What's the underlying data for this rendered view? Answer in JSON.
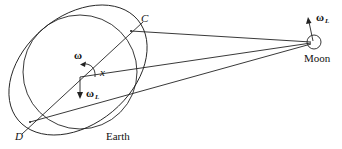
{
  "diagram": {
    "labels": {
      "point_c": "C",
      "point_d": "D",
      "axis_x": "x",
      "earth": "Earth",
      "moon": "Moon",
      "omega": "ω",
      "omega_l_earth": "ω",
      "omega_l_earth_sub": "L",
      "omega_l_moon": "ω",
      "omega_l_moon_sub": "L"
    },
    "colors": {
      "stroke": "#222222",
      "background": "#ffffff"
    },
    "shapes": {
      "earth_circle": {
        "cx": 80,
        "cy": 71,
        "r": 57
      },
      "bulge_ellipse": {
        "cx": 77,
        "cy": 71,
        "rx": 77,
        "ry": 55,
        "rotate": -38
      },
      "moon_circle": {
        "cx": 314,
        "cy": 42,
        "r": 7
      }
    }
  }
}
